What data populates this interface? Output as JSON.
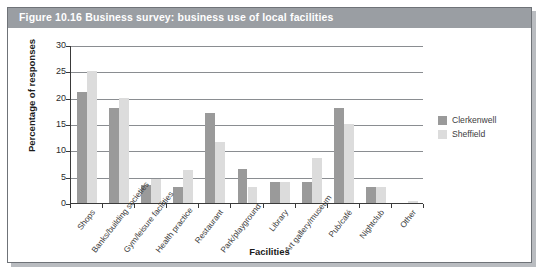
{
  "figure": {
    "title": "Figure 10.16  Business survey: business use of local facilities",
    "title_bar_color": "#9a9ea3",
    "frame_border_color": "#6f7378"
  },
  "chart_data": {
    "type": "bar",
    "title": "Business survey: business use of local facilities",
    "xlabel": "Facilities",
    "ylabel": "Percentage of responses",
    "ylim": [
      0,
      30
    ],
    "ytick_labels": [
      "30",
      "25",
      "20",
      "15",
      "10",
      "5",
      "0"
    ],
    "ytick_values": [
      30,
      25,
      20,
      15,
      10,
      5,
      0
    ],
    "grid": true,
    "grid_axis": "y",
    "legend_position": "right",
    "categories": [
      "Shops",
      "Banks/building societies",
      "Gym/leisure facilities",
      "Health practice",
      "Restaurant",
      "Park/playground",
      "Library",
      "Art gallery/museum",
      "Pub/café",
      "Nightclub",
      "Other"
    ],
    "series": [
      {
        "name": "Clerkenwell",
        "color": "#9a9a9a",
        "values": [
          21,
          18,
          3.5,
          3,
          17,
          6.5,
          4,
          4,
          18,
          3,
          0
        ]
      },
      {
        "name": "Sheffield",
        "color": "#dcdcdc",
        "values": [
          25,
          20,
          4.5,
          6.3,
          11.5,
          3,
          4,
          8.5,
          15,
          3,
          0.3
        ]
      }
    ]
  }
}
